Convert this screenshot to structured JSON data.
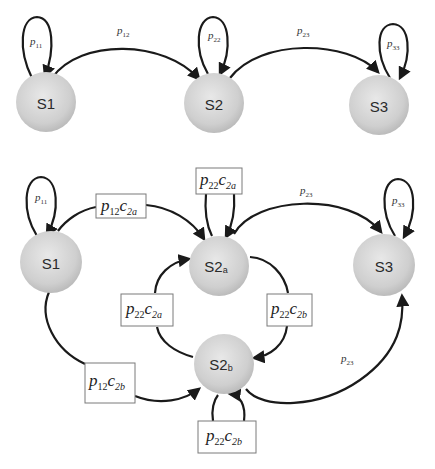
{
  "diagram": {
    "title": "",
    "colors": {
      "node_fill_light": "#e6e6e6",
      "node_fill_dark": "#b8b8b8",
      "edge": "#1a1a1a",
      "box_border": "#7a7a7a"
    },
    "top_chain": {
      "nodes": [
        {
          "id": "S1",
          "label": "S1"
        },
        {
          "id": "S2",
          "label": "S2"
        },
        {
          "id": "S3",
          "label": "S3"
        }
      ],
      "edges": [
        {
          "from": "S1",
          "to": "S1",
          "label_p": "p",
          "label_sub": "11"
        },
        {
          "from": "S1",
          "to": "S2",
          "label_p": "p",
          "label_sub": "12"
        },
        {
          "from": "S2",
          "to": "S2",
          "label_p": "p",
          "label_sub": "22"
        },
        {
          "from": "S2",
          "to": "S3",
          "label_p": "p",
          "label_sub": "23"
        },
        {
          "from": "S3",
          "to": "S3",
          "label_p": "p",
          "label_sub": "33"
        }
      ]
    },
    "bottom_chain": {
      "nodes": [
        {
          "id": "S1",
          "label": "S1",
          "sub": ""
        },
        {
          "id": "S2a",
          "label": "S2",
          "sub": "a"
        },
        {
          "id": "S3",
          "label": "S3",
          "sub": ""
        },
        {
          "id": "S2b",
          "label": "S2",
          "sub": "b"
        }
      ],
      "edges": [
        {
          "from": "S1",
          "to": "S1",
          "label_p": "p",
          "label_sub": "11"
        },
        {
          "from": "S1",
          "to": "S2a",
          "p": "p",
          "p_sub": "12",
          "c": "c",
          "c_sub": "2a"
        },
        {
          "from": "S2a",
          "to": "S2a",
          "p": "p",
          "p_sub": "22",
          "c": "c",
          "c_sub": "2a"
        },
        {
          "from": "S2a",
          "to": "S3",
          "label_p": "p",
          "label_sub": "23"
        },
        {
          "from": "S3",
          "to": "S3",
          "label_p": "p",
          "label_sub": "33"
        },
        {
          "from": "S2b",
          "to": "S2a",
          "p": "p",
          "p_sub": "22",
          "c": "c",
          "c_sub": "2a"
        },
        {
          "from": "S2a",
          "to": "S2b",
          "p": "p",
          "p_sub": "22",
          "c": "c",
          "c_sub": "2b"
        },
        {
          "from": "S1",
          "to": "S2b",
          "p": "p",
          "p_sub": "12",
          "c": "c",
          "c_sub": "2b"
        },
        {
          "from": "S2b",
          "to": "S2b",
          "p": "p",
          "p_sub": "22",
          "c": "c",
          "c_sub": "2b"
        },
        {
          "from": "S2b",
          "to": "S3",
          "label_p": "p",
          "label_sub": "23"
        }
      ]
    }
  }
}
